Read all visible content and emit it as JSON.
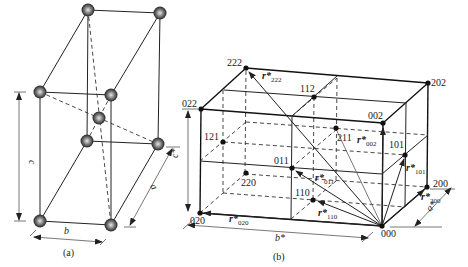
{
  "figure_a": {
    "caption": "(a)",
    "dimension_labels": {
      "a": "a",
      "b": "b",
      "c": "c"
    },
    "atom_color": "#4a4a4a"
  },
  "figure_b": {
    "caption": "(b)",
    "axis_labels": {
      "a_star": "a*",
      "b_star": "b*",
      "c_star": "c*"
    },
    "points": {
      "p000": "000",
      "p200": "200",
      "p020": "020",
      "p002": "002",
      "p022": "022",
      "p202": "202",
      "p222": "222",
      "p112": "112",
      "p121": "121",
      "p211": "211",
      "p101": "101",
      "p011": "011",
      "p110": "110",
      "p220": "220"
    },
    "vectors": {
      "r222": {
        "base": "r*",
        "sub": "222"
      },
      "r002": {
        "base": "r*",
        "sub": "002"
      },
      "r101": {
        "base": "r*",
        "sub": "101"
      },
      "r011": {
        "base": "r*",
        "sub": "011"
      },
      "r110": {
        "base": "r*",
        "sub": "110"
      },
      "r020": {
        "base": "r*",
        "sub": "020"
      },
      "r200": {
        "base": "r*",
        "sub": "200"
      }
    }
  }
}
